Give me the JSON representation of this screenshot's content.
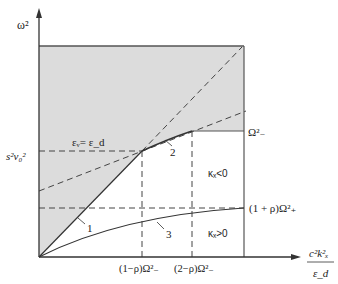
{
  "diagram": {
    "type": "dispersion-diagram",
    "y_axis_label": "ω²",
    "x_axis_label_numerator": "c²k²ₓ",
    "x_axis_label_denominator": "ε_d",
    "y_tick_label": "s²v₀²",
    "x_tick_labels": [
      "(1−ρ)Ω²₋",
      "(2−ρ)Ω²₋"
    ],
    "right_labels": {
      "omega_minus": "Ω²₋",
      "one_plus_rho": "(1 + ρ)Ω²₊"
    },
    "region_labels": {
      "kappa_negative": "κₓ<0",
      "kappa_positive": "κₓ>0"
    },
    "line_label_equal": "εᵥ= ε_d",
    "curve_labels": [
      "1",
      "2",
      "3"
    ],
    "colors": {
      "shade": "#dcdcdc",
      "line": "#333333",
      "dashed": "#444444",
      "background": "#ffffff"
    }
  }
}
